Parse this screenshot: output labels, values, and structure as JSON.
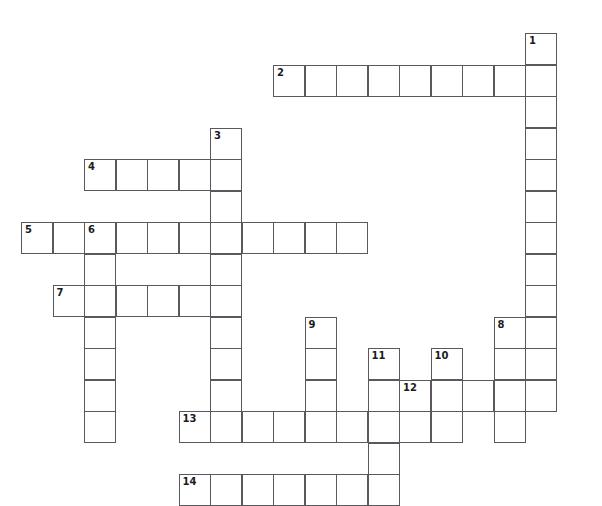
{
  "page": {
    "clipped_header_text": "",
    "background_color": "#ffffff",
    "grid_line_color": "#58585e",
    "number_color": "#1b1b1f"
  },
  "grid": {
    "cell_size": 31.5,
    "origin_x": 21,
    "origin_y": 33,
    "columns": 17,
    "rows": 15
  },
  "entries": [
    {
      "number": "1",
      "direction": "down",
      "row": 0,
      "col": 16,
      "length": 11
    },
    {
      "number": "2",
      "direction": "across",
      "row": 1,
      "col": 8,
      "length": 9
    },
    {
      "number": "3",
      "direction": "down",
      "row": 3,
      "col": 6,
      "length": 10
    },
    {
      "number": "4",
      "direction": "across",
      "row": 4,
      "col": 2,
      "length": 5
    },
    {
      "number": "5",
      "direction": "across",
      "row": 6,
      "col": 0,
      "length": 11
    },
    {
      "number": "6",
      "direction": "down",
      "row": 6,
      "col": 2,
      "length": 7
    },
    {
      "number": "7",
      "direction": "across",
      "row": 8,
      "col": 1,
      "length": 6
    },
    {
      "number": "8",
      "direction": "down",
      "row": 9,
      "col": 15,
      "length": 4
    },
    {
      "number": "9",
      "direction": "down",
      "row": 9,
      "col": 9,
      "length": 4
    },
    {
      "number": "10",
      "direction": "down",
      "row": 10,
      "col": 13,
      "length": 3
    },
    {
      "number": "11",
      "direction": "down",
      "row": 10,
      "col": 11,
      "length": 5
    },
    {
      "number": "12",
      "direction": "across",
      "row": 11,
      "col": 12,
      "length": 5
    },
    {
      "number": "13",
      "direction": "across",
      "row": 12,
      "col": 5,
      "length": 9
    },
    {
      "number": "14",
      "direction": "across",
      "row": 14,
      "col": 5,
      "length": 7
    }
  ],
  "numbered_cells": [
    {
      "label": "1",
      "row": 0,
      "col": 16
    },
    {
      "label": "2",
      "row": 1,
      "col": 8
    },
    {
      "label": "3",
      "row": 3,
      "col": 6
    },
    {
      "label": "4",
      "row": 4,
      "col": 2
    },
    {
      "label": "5",
      "row": 6,
      "col": 0
    },
    {
      "label": "6",
      "row": 6,
      "col": 2
    },
    {
      "label": "7",
      "row": 8,
      "col": 1
    },
    {
      "label": "8",
      "row": 9,
      "col": 15
    },
    {
      "label": "9",
      "row": 9,
      "col": 9
    },
    {
      "label": "10",
      "row": 10,
      "col": 13
    },
    {
      "label": "11",
      "row": 10,
      "col": 11
    },
    {
      "label": "12",
      "row": 11,
      "col": 12
    },
    {
      "label": "13",
      "row": 12,
      "col": 5
    },
    {
      "label": "14",
      "row": 14,
      "col": 5
    }
  ],
  "letters": []
}
